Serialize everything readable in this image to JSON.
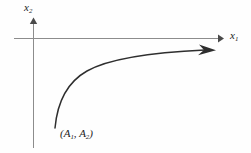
{
  "figure": {
    "background_color": "#fefefe",
    "axis_color": "#8c8c8c",
    "curve_color": "#2e2e2e",
    "text_color": "#1c1c1c",
    "width": 251,
    "height": 153
  },
  "axes": {
    "horizontal": {
      "label_base": "x",
      "label_sub": "1",
      "icon": "arrow-right-icon",
      "y_position": 38,
      "x_start": 14,
      "x_end": 222
    },
    "vertical": {
      "label_base": "x",
      "label_sub": "2",
      "icon": "arrow-up-icon",
      "x_position": 33,
      "y_start": 148,
      "y_end": 19
    }
  },
  "curve": {
    "name": "trajectory",
    "icon": "arrow-right-icon",
    "start_point": {
      "x": 55,
      "y": 128
    },
    "end_point": {
      "x": 214,
      "y": 50
    },
    "path": "M 55 128 C 57 104, 66 82, 88 70 C 112 57, 160 52, 206 50"
  },
  "annotations": {
    "initial_point": {
      "open_paren": "(",
      "first_base": "A",
      "first_sub": "1",
      "comma": ", ",
      "second_base": "A",
      "second_sub": "2",
      "close_paren": ")"
    }
  }
}
